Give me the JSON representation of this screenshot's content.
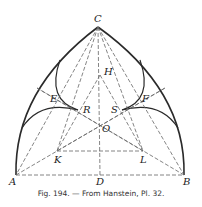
{
  "figure": {
    "caption": "Fig. 194. — From Hanstein, Pl. 32.",
    "labels": {
      "C": "C",
      "H": "H",
      "E": "E",
      "F": "F",
      "R": "R",
      "S": "S",
      "O": "O",
      "K": "K",
      "L": "L",
      "A": "A",
      "D": "D",
      "B": "B"
    },
    "points": {
      "A": [
        16,
        175
      ],
      "B": [
        184,
        175
      ],
      "C": [
        98,
        27
      ],
      "D": [
        100,
        175
      ],
      "H": [
        100,
        75
      ],
      "O": [
        100,
        124
      ],
      "K": [
        57,
        151
      ],
      "L": [
        143,
        151
      ],
      "R": [
        78,
        110
      ],
      "S": [
        122,
        110
      ],
      "E": [
        57,
        98
      ],
      "F": [
        145,
        98
      ]
    },
    "colors": {
      "line": "#2a2a2a",
      "dashed": "#666666",
      "background": "#ffffff"
    }
  }
}
